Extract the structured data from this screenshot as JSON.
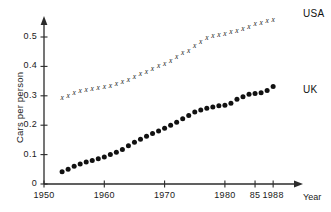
{
  "chart_data": {
    "type": "scatter",
    "title": "",
    "xlabel": "Year",
    "ylabel": "Cars per person",
    "xlim": [
      1950,
      1990
    ],
    "ylim": [
      0,
      0.57
    ],
    "grid": false,
    "legend_position": "right-inline",
    "xticks": [
      {
        "value": 1950,
        "label": "1950"
      },
      {
        "value": 1960,
        "label": "1960"
      },
      {
        "value": 1970,
        "label": "1970"
      },
      {
        "value": 1980,
        "label": "1980"
      },
      {
        "value": 1985,
        "label": "85"
      },
      {
        "value": 1988,
        "label": "1988"
      }
    ],
    "yticks": [
      {
        "value": 0,
        "label": "0"
      },
      {
        "value": 0.1,
        "label": "0.1"
      },
      {
        "value": 0.2,
        "label": "0.2"
      },
      {
        "value": 0.3,
        "label": "0.3"
      },
      {
        "value": 0.4,
        "label": "0.4"
      },
      {
        "value": 0.5,
        "label": "0.5"
      }
    ],
    "series": [
      {
        "name": "USA",
        "marker": "x",
        "color": "#1a1a1a",
        "x": [
          1953,
          1954,
          1955,
          1956,
          1957,
          1958,
          1959,
          1960,
          1961,
          1962,
          1963,
          1964,
          1965,
          1966,
          1967,
          1968,
          1969,
          1970,
          1971,
          1972,
          1973,
          1974,
          1975,
          1976,
          1977,
          1978,
          1979,
          1980,
          1981,
          1982,
          1983,
          1984,
          1985,
          1986,
          1987,
          1988
        ],
        "values": [
          0.295,
          0.303,
          0.311,
          0.317,
          0.322,
          0.325,
          0.33,
          0.333,
          0.337,
          0.343,
          0.35,
          0.357,
          0.366,
          0.375,
          0.383,
          0.392,
          0.402,
          0.41,
          0.421,
          0.434,
          0.447,
          0.455,
          0.47,
          0.486,
          0.497,
          0.505,
          0.51,
          0.513,
          0.518,
          0.523,
          0.528,
          0.537,
          0.545,
          0.55,
          0.557,
          0.56
        ]
      },
      {
        "name": "UK",
        "marker": "o",
        "color": "#111111",
        "x": [
          1953,
          1954,
          1955,
          1956,
          1957,
          1958,
          1959,
          1960,
          1961,
          1962,
          1963,
          1964,
          1965,
          1966,
          1967,
          1968,
          1969,
          1970,
          1971,
          1972,
          1973,
          1974,
          1975,
          1976,
          1977,
          1978,
          1979,
          1980,
          1981,
          1982,
          1983,
          1984,
          1985,
          1986,
          1987,
          1988
        ],
        "values": [
          0.042,
          0.05,
          0.06,
          0.068,
          0.075,
          0.08,
          0.086,
          0.092,
          0.1,
          0.108,
          0.117,
          0.13,
          0.142,
          0.152,
          0.162,
          0.172,
          0.18,
          0.19,
          0.2,
          0.21,
          0.222,
          0.233,
          0.245,
          0.252,
          0.258,
          0.262,
          0.266,
          0.268,
          0.275,
          0.288,
          0.297,
          0.305,
          0.308,
          0.31,
          0.318,
          0.332
        ]
      }
    ],
    "annotations": [
      {
        "name": "usa-series-label",
        "text": "USA"
      },
      {
        "name": "uk-series-label",
        "text": "UK"
      }
    ]
  }
}
